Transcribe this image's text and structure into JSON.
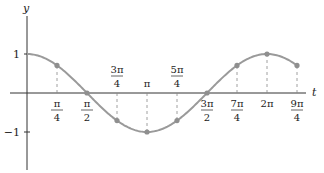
{
  "chart_data": {
    "type": "line",
    "title": "",
    "function": "cos(t)",
    "xlabel": "t",
    "ylabel": "y",
    "ylim": [
      -1.4,
      1.4
    ],
    "xlim": [
      0,
      7.4
    ],
    "grid": false,
    "legend": null,
    "y_ticks": [
      {
        "value": 1,
        "label": "1"
      },
      {
        "value": -1,
        "label": "−1"
      }
    ],
    "x_ticks": [
      {
        "value": 0.7854,
        "num": "π",
        "den": "4",
        "pos": "below"
      },
      {
        "value": 1.5708,
        "num": "π",
        "den": "2",
        "pos": "below"
      },
      {
        "value": 2.3562,
        "num": "3π",
        "den": "4",
        "pos": "above"
      },
      {
        "value": 3.1416,
        "num": "π",
        "den": "",
        "pos": "above"
      },
      {
        "value": 3.927,
        "num": "5π",
        "den": "4",
        "pos": "above"
      },
      {
        "value": 4.7124,
        "num": "3π",
        "den": "2",
        "pos": "below"
      },
      {
        "value": 5.4978,
        "num": "7π",
        "den": "4",
        "pos": "below"
      },
      {
        "value": 6.2832,
        "num": "2π",
        "den": "",
        "pos": "below"
      },
      {
        "value": 7.0686,
        "num": "9π",
        "den": "4",
        "pos": "below"
      }
    ],
    "points": [
      {
        "t": 0.7854,
        "y": 0.7071
      },
      {
        "t": 1.5708,
        "y": 0.0
      },
      {
        "t": 2.3562,
        "y": -0.7071
      },
      {
        "t": 3.1416,
        "y": -1.0
      },
      {
        "t": 3.927,
        "y": -0.7071
      },
      {
        "t": 4.7124,
        "y": 0.0
      },
      {
        "t": 5.4978,
        "y": 0.7071
      },
      {
        "t": 6.2832,
        "y": 1.0
      },
      {
        "t": 7.0686,
        "y": 0.7071
      }
    ],
    "curve_domain": [
      0,
      7.0686
    ],
    "colors": {
      "curve": "#9a9a9a",
      "points": "#8f8f8f",
      "axes": "#333333",
      "dashes": "#888888"
    }
  }
}
